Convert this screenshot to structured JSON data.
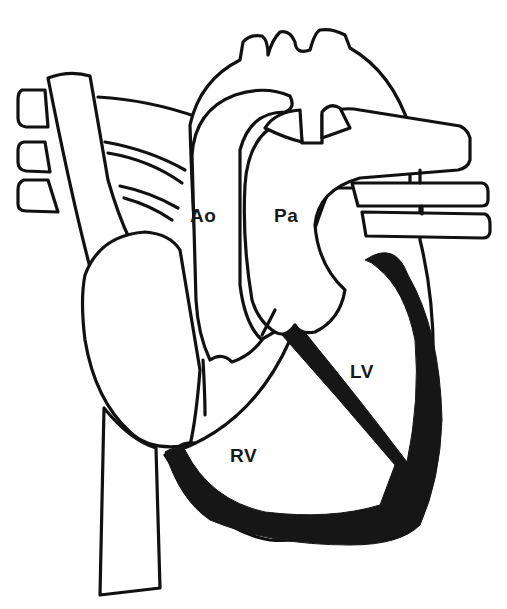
{
  "diagram": {
    "type": "anatomical line drawing",
    "colors": {
      "stroke": "#111111",
      "myocardium_fill": "#161616",
      "background": "#ffffff"
    },
    "labels": {
      "aorta": "Ao",
      "pulmonary_artery": "Pa",
      "left_ventricle": "LV",
      "right_ventricle": "RV"
    }
  }
}
